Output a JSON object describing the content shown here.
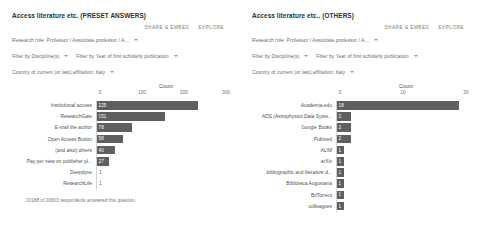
{
  "panels": [
    {
      "title": "Access literature etc. (PRESET ANSWERS)",
      "actions": {
        "share": "SHARE & EMBED",
        "explore": "EXPLORE"
      },
      "filters": {
        "research_role": "Research role: Professor / Associate professor / A...",
        "discipline": "Filter by Discipline(s)",
        "year": "Filter by Year of first scholarly publication",
        "country": "Country of current (or last) affiliation: Italy"
      },
      "footnote": "20188 of 20663 respondents answered this question",
      "chart_data": {
        "type": "bar",
        "orientation": "horizontal",
        "title": "Access literature etc. (PRESET ANSWERS)",
        "xlabel": "Count",
        "ylabel": "",
        "xlim": [
          0,
          300
        ],
        "xticks": [
          0,
          100,
          200,
          300
        ],
        "grid": false,
        "legend": "none",
        "categories": [
          "Institutional access",
          "ResearchGate",
          "E-mail the author",
          "Open Access Button",
          "(and also) others",
          "Pay per view on publisher pl...",
          "Deepdyve",
          "ResearchLife"
        ],
        "values": [
          225,
          151,
          78,
          58,
          40,
          27,
          1,
          1
        ]
      }
    },
    {
      "title": "Access literature etc.. (OTHERS)",
      "actions": {
        "share": "SHARE & EMBED",
        "explore": "EXPLORE"
      },
      "filters": {
        "research_role": "Research role: Professor / Associate professor / A...",
        "discipline": "Filter by Discipline(s)",
        "year": "Filter by Year of first scholarly publication",
        "country": "Country of current (or last) affiliation: Italy"
      },
      "footnote": "",
      "chart_data": {
        "type": "bar",
        "orientation": "horizontal",
        "title": "Access literature etc.. (OTHERS)",
        "xlabel": "Count",
        "ylabel": "",
        "xlim": [
          0,
          20
        ],
        "xticks": [
          0,
          10,
          20
        ],
        "grid": false,
        "legend": "none",
        "categories": [
          "Academia.edu",
          "ADS (Astrophysics Data Syste...",
          "Google Books",
          "Pubmed",
          "ALIM",
          "arXiv",
          "bibliographic and literature d...",
          "Biblioteca Augustana",
          "BitTorrent",
          "colleagues"
        ],
        "values": [
          18,
          2,
          2,
          2,
          1,
          1,
          1,
          1,
          1,
          1
        ]
      }
    }
  ]
}
